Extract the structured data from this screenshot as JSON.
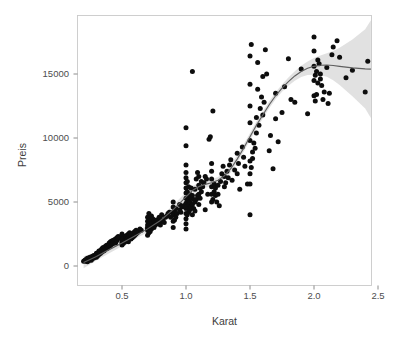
{
  "chart_data": {
    "type": "scatter",
    "title": "",
    "xlabel": "Karat",
    "ylabel": "Preis",
    "xlim": [
      0.13,
      2.62
    ],
    "ylim": [
      -1250,
      19400
    ],
    "grid": false,
    "legend": null,
    "xticks": [
      "0.5",
      "1.0",
      "1.5",
      "2.0",
      "2.5"
    ],
    "xtick_values": [
      0.5,
      1.0,
      1.5,
      2.0,
      2.5
    ],
    "yticks": [
      "0",
      "5000",
      "10000",
      "15000"
    ],
    "ytick_values": [
      0,
      5000,
      10000,
      15000
    ],
    "point_color": "#0d0d0d",
    "smooth_line_color": "#5f5f5f",
    "smooth_band_color": "#9a9a9a",
    "panel_border_color": "#c9c9c9",
    "background_color": "#ffffff",
    "series": [
      {
        "name": "diamonds",
        "marker": "filled-circle",
        "x": [
          0.2,
          0.21,
          0.21,
          0.22,
          0.22,
          0.23,
          0.23,
          0.23,
          0.23,
          0.23,
          0.24,
          0.24,
          0.24,
          0.25,
          0.25,
          0.25,
          0.26,
          0.26,
          0.26,
          0.26,
          0.27,
          0.27,
          0.27,
          0.28,
          0.28,
          0.28,
          0.29,
          0.29,
          0.3,
          0.3,
          0.3,
          0.3,
          0.3,
          0.3,
          0.31,
          0.31,
          0.31,
          0.31,
          0.32,
          0.32,
          0.32,
          0.32,
          0.33,
          0.33,
          0.33,
          0.34,
          0.34,
          0.34,
          0.35,
          0.35,
          0.35,
          0.35,
          0.36,
          0.36,
          0.36,
          0.37,
          0.37,
          0.38,
          0.38,
          0.38,
          0.39,
          0.39,
          0.4,
          0.4,
          0.4,
          0.4,
          0.41,
          0.41,
          0.41,
          0.42,
          0.42,
          0.42,
          0.43,
          0.43,
          0.43,
          0.44,
          0.44,
          0.45,
          0.45,
          0.46,
          0.46,
          0.47,
          0.47,
          0.48,
          0.5,
          0.5,
          0.5,
          0.5,
          0.5,
          0.5,
          0.51,
          0.51,
          0.51,
          0.51,
          0.52,
          0.52,
          0.52,
          0.53,
          0.53,
          0.53,
          0.54,
          0.54,
          0.54,
          0.55,
          0.55,
          0.55,
          0.56,
          0.56,
          0.57,
          0.57,
          0.58,
          0.58,
          0.59,
          0.59,
          0.6,
          0.6,
          0.61,
          0.61,
          0.62,
          0.63,
          0.64,
          0.65,
          0.7,
          0.7,
          0.7,
          0.7,
          0.7,
          0.7,
          0.7,
          0.71,
          0.71,
          0.71,
          0.72,
          0.72,
          0.72,
          0.72,
          0.73,
          0.73,
          0.73,
          0.74,
          0.74,
          0.75,
          0.75,
          0.76,
          0.76,
          0.77,
          0.78,
          0.79,
          0.8,
          0.8,
          0.8,
          0.81,
          0.82,
          0.83,
          0.84,
          0.85,
          0.86,
          0.87,
          0.88,
          0.9,
          0.9,
          0.9,
          0.9,
          0.9,
          0.9,
          0.91,
          0.91,
          0.92,
          0.92,
          0.93,
          0.95,
          0.95,
          0.96,
          0.97,
          0.98,
          1.0,
          1.0,
          1.0,
          1.0,
          1.0,
          1.0,
          1.0,
          1.0,
          1.0,
          1.0,
          1.0,
          1.0,
          1.0,
          1.0,
          1.0,
          1.01,
          1.01,
          1.01,
          1.01,
          1.01,
          1.02,
          1.02,
          1.02,
          1.02,
          1.03,
          1.03,
          1.03,
          1.04,
          1.04,
          1.04,
          1.05,
          1.05,
          1.05,
          1.05,
          1.06,
          1.06,
          1.07,
          1.07,
          1.07,
          1.08,
          1.08,
          1.09,
          1.09,
          1.1,
          1.1,
          1.1,
          1.1,
          1.11,
          1.11,
          1.12,
          1.12,
          1.13,
          1.14,
          1.15,
          1.15,
          1.16,
          1.17,
          1.18,
          1.19,
          1.2,
          1.2,
          1.2,
          1.2,
          1.2,
          1.2,
          1.21,
          1.21,
          1.22,
          1.22,
          1.23,
          1.23,
          1.24,
          1.25,
          1.25,
          1.26,
          1.27,
          1.28,
          1.29,
          1.3,
          1.3,
          1.31,
          1.32,
          1.33,
          1.34,
          1.35,
          1.36,
          1.38,
          1.4,
          1.4,
          1.41,
          1.42,
          1.44,
          1.45,
          1.46,
          1.48,
          1.5,
          1.5,
          1.5,
          1.5,
          1.5,
          1.5,
          1.5,
          1.5,
          1.5,
          1.51,
          1.51,
          1.52,
          1.52,
          1.53,
          1.54,
          1.55,
          1.55,
          1.56,
          1.56,
          1.57,
          1.58,
          1.59,
          1.6,
          1.6,
          1.61,
          1.62,
          1.63,
          1.65,
          1.66,
          1.68,
          1.7,
          1.7,
          1.72,
          1.75,
          1.77,
          1.8,
          1.82,
          1.85,
          1.9,
          1.95,
          2.0,
          2.0,
          2.0,
          2.0,
          2.0,
          2.01,
          2.01,
          2.02,
          2.02,
          2.03,
          2.03,
          2.04,
          2.05,
          2.05,
          2.06,
          2.07,
          2.08,
          2.1,
          2.11,
          2.12,
          2.14,
          2.15,
          2.18,
          2.2,
          2.25,
          2.3,
          2.4,
          2.42,
          2.5
        ],
        "y": [
          365,
          402,
          445,
          380,
          520,
          430,
          480,
          560,
          610,
          340,
          500,
          620,
          420,
          550,
          480,
          680,
          600,
          520,
          710,
          450,
          640,
          580,
          760,
          700,
          620,
          820,
          780,
          700,
          850,
          920,
          760,
          1000,
          680,
          880,
          950,
          880,
          1020,
          800,
          1000,
          1100,
          900,
          1180,
          1050,
          1200,
          980,
          1150,
          1300,
          1080,
          1250,
          1380,
          1150,
          1420,
          1300,
          1450,
          1200,
          1400,
          1550,
          1500,
          1350,
          1620,
          1600,
          1450,
          1700,
          1550,
          1800,
          1650,
          1750,
          1900,
          1600,
          1800,
          1950,
          1700,
          1850,
          2000,
          1750,
          1900,
          2050,
          1800,
          2100,
          2000,
          2200,
          2150,
          2300,
          2250,
          2400,
          2500,
          1650,
          1800,
          1900,
          2050,
          2200,
          1750,
          1900,
          2100,
          2300,
          1850,
          2000,
          2200,
          2350,
          1950,
          2150,
          2400,
          2050,
          2250,
          2500,
          1900,
          2300,
          2600,
          2100,
          2400,
          2200,
          2500,
          2300,
          2600,
          2400,
          2700,
          2500,
          2800,
          2600,
          2700,
          2900,
          2800,
          3000,
          2800,
          2400,
          2900,
          3200,
          3500,
          3800,
          4100,
          2600,
          3000,
          3400,
          2700,
          3100,
          3600,
          3900,
          2900,
          3300,
          3700,
          3100,
          3500,
          3000,
          3400,
          3200,
          3600,
          3300,
          3800,
          3500,
          3200,
          3700,
          4000,
          3600,
          3400,
          3800,
          3900,
          4100,
          4200,
          3800,
          4200,
          3000,
          3500,
          4000,
          4600,
          5000,
          3600,
          4300,
          3800,
          4500,
          4100,
          4400,
          4800,
          4200,
          4600,
          4700,
          2900,
          3300,
          3700,
          4100,
          4500,
          4900,
          5300,
          5700,
          6100,
          6500,
          6900,
          7300,
          7900,
          9400,
          10800,
          4000,
          4600,
          5200,
          5800,
          6600,
          4200,
          4800,
          5400,
          6200,
          4400,
          5000,
          5600,
          4600,
          5300,
          6100,
          4000,
          4800,
          5500,
          15200,
          4500,
          5200,
          4300,
          5000,
          6000,
          5200,
          6800,
          5500,
          7300,
          4800,
          5600,
          6300,
          7000,
          5300,
          6100,
          5800,
          6600,
          6200,
          6500,
          4400,
          7000,
          6800,
          5600,
          9900,
          10100,
          5000,
          5600,
          6200,
          6800,
          7400,
          8000,
          12100,
          5200,
          5800,
          6400,
          5500,
          6100,
          5000,
          5600,
          6300,
          4700,
          6600,
          7200,
          7800,
          6200,
          7000,
          6500,
          7400,
          6900,
          7900,
          8300,
          6700,
          7500,
          8800,
          7200,
          8000,
          6000,
          9300,
          8500,
          7800,
          6400,
          4000,
          6400,
          7200,
          8200,
          9800,
          11200,
          12500,
          14200,
          16400,
          17300,
          7700,
          8400,
          8900,
          9600,
          9200,
          10400,
          11600,
          13800,
          15900,
          11000,
          12300,
          13200,
          11800,
          14800,
          12800,
          16900,
          15000,
          9000,
          10200,
          7600,
          13500,
          11500,
          9700,
          12000,
          14000,
          16200,
          13000,
          12800,
          15400,
          11900,
          17900,
          13300,
          15600,
          14500,
          16800,
          14900,
          12900,
          13400,
          15200,
          14300,
          16100,
          15800,
          15000,
          14600,
          14100,
          13000,
          13600,
          15500,
          12700,
          13500,
          16500,
          17100,
          17600,
          16300,
          14700,
          15300,
          13600,
          16000,
          18300
        ]
      }
    ],
    "smooth": {
      "method": "loess",
      "x": [
        0.2,
        0.3,
        0.4,
        0.5,
        0.6,
        0.7,
        0.8,
        0.9,
        1.0,
        1.05,
        1.1,
        1.15,
        1.2,
        1.25,
        1.3,
        1.35,
        1.4,
        1.45,
        1.5,
        1.55,
        1.6,
        1.65,
        1.7,
        1.75,
        1.8,
        1.85,
        1.9,
        1.95,
        2.0,
        2.05,
        2.1,
        2.15,
        2.2,
        2.3,
        2.4,
        2.5
      ],
      "y": [
        280,
        750,
        1280,
        1800,
        2350,
        2900,
        3550,
        4400,
        5400,
        5900,
        6200,
        6380,
        6500,
        6700,
        7050,
        7600,
        8350,
        9200,
        10100,
        11000,
        11800,
        12600,
        13300,
        13900,
        14400,
        14850,
        15200,
        15450,
        15600,
        15680,
        15700,
        15660,
        15600,
        15480,
        15400,
        15380
      ],
      "band_upper": [
        760,
        1080,
        1560,
        2050,
        2590,
        3160,
        3840,
        4740,
        5780,
        6250,
        6520,
        6650,
        6760,
        6960,
        7330,
        7900,
        8650,
        9490,
        10370,
        11280,
        12080,
        12880,
        13570,
        14180,
        14720,
        15220,
        15640,
        15980,
        16250,
        16450,
        16620,
        16800,
        17050,
        17700,
        18500,
        19200
      ],
      "band_lower": [
        -180,
        420,
        1000,
        1550,
        2110,
        2640,
        3260,
        4060,
        5020,
        5550,
        5880,
        6110,
        6240,
        6440,
        6770,
        7300,
        8050,
        8910,
        9830,
        10720,
        11520,
        12320,
        13030,
        13620,
        14080,
        14480,
        14760,
        14920,
        14950,
        14910,
        14780,
        14520,
        14150,
        13260,
        12300,
        11560
      ]
    }
  },
  "axes": {
    "y_title": "Preis",
    "x_title": "Karat"
  }
}
